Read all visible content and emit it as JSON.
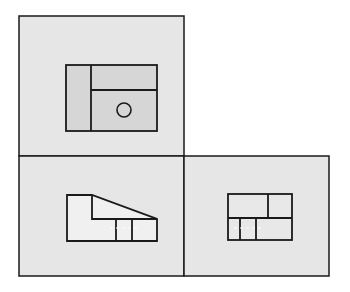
{
  "diagram": {
    "type": "orthographic-projection",
    "colors": {
      "background": "#ffffff",
      "panel_fill": "#e6e6e6",
      "top_view_fill": "#d6d6d6",
      "front_view_fill": "#f0f0f0",
      "side_view_fill": "#e8e8e8",
      "stroke": "#1a1a1a"
    },
    "panels": [
      {
        "name": "top-view-panel",
        "x": 19,
        "y": 16,
        "w": 165,
        "h": 140
      },
      {
        "name": "front-view-panel",
        "x": 19,
        "y": 156,
        "w": 165,
        "h": 120
      },
      {
        "name": "side-view-panel",
        "x": 184,
        "y": 156,
        "w": 145,
        "h": 120
      }
    ],
    "views": {
      "top": {
        "outline": {
          "x": 66,
          "y": 65,
          "w": 91,
          "h": 66
        },
        "vertical_divider_x": 91,
        "horizontal_divider_y": 90,
        "hole": {
          "cx": 124,
          "cy": 110,
          "r": 7
        }
      },
      "front": {
        "outline_points": "67,195 92,195 157,219 157,241 67,241",
        "step_line": "92,195 92,219 157,219",
        "slot_lines_x": [
          116,
          132
        ],
        "slot_y": [
          219,
          241
        ],
        "hidden_y": 228
      },
      "side": {
        "outline": {
          "x": 228,
          "y": 194,
          "w": 64,
          "h": 46
        },
        "horizontal_divider_y": 218,
        "top_vertical_x": 268,
        "bottom_verticals_x": [
          240,
          256
        ],
        "hidden_y": 228
      }
    }
  }
}
